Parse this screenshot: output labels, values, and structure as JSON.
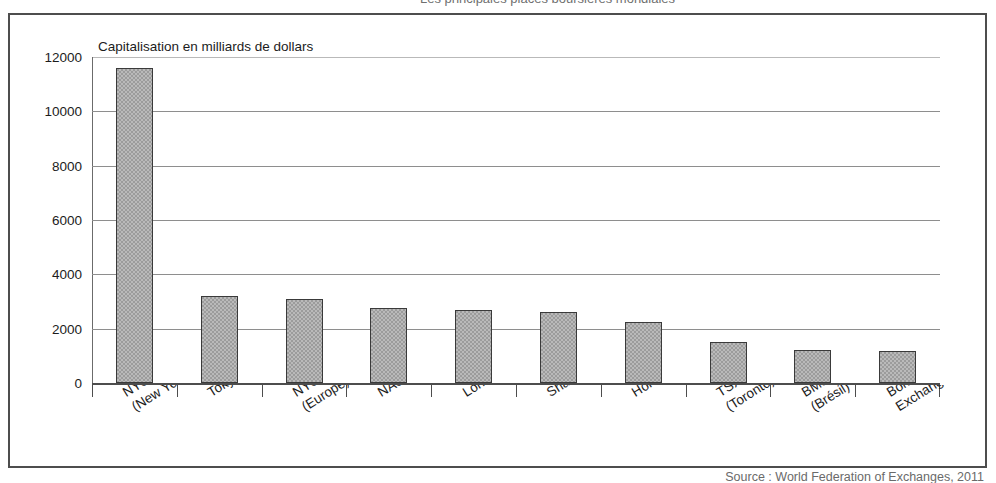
{
  "figure": {
    "top_caption": "Les principales places boursières mondiales",
    "source_note": "Source : World Federation of Exchanges, 2011"
  },
  "chart_data": {
    "type": "bar",
    "title": "Capitalisation en milliards de dollars",
    "xlabel": "",
    "ylabel": "",
    "ylim": [
      0,
      12000
    ],
    "ytick_values": [
      0,
      2000,
      4000,
      6000,
      8000,
      10000,
      12000
    ],
    "ytick_labels": [
      "0",
      "2000",
      "4000",
      "6000",
      "8000",
      "10000",
      "12000"
    ],
    "grid": true,
    "legend": false,
    "bar_color": "#9c9c9c",
    "bar_border_color": "#3a3a3a",
    "categories": [
      "NYSE Euronext\n(New York)",
      "Tokyo Stock Exchange",
      "NYSE Euronext'\n(Europe)",
      "NASDAQ OMX",
      "London SE",
      "Shanghai SE",
      "Hong Kong Exchanges",
      "TSX Group\n(Toronto)",
      "BM&FBovespa\n(Brésil)",
      "Bombay Stock\nExchange (Inde)"
    ],
    "category_lines": [
      [
        "NYSE Euronext",
        "(New York)"
      ],
      [
        "Tokyo Stock Exchange"
      ],
      [
        "NYSE Euronext'",
        "(Europe)"
      ],
      [
        "NASDAQ OMX"
      ],
      [
        "London SE"
      ],
      [
        "Shanghai SE"
      ],
      [
        "Hong Kong Exchanges"
      ],
      [
        "TSX Group",
        "(Toronto)"
      ],
      [
        "BM&FBovespa",
        "(Brésil)"
      ],
      [
        "Bombay Stock",
        "Exchange (Inde)"
      ]
    ],
    "values": [
      11600,
      3200,
      3100,
      2760,
      2700,
      2600,
      2250,
      1500,
      1230,
      1180
    ]
  }
}
